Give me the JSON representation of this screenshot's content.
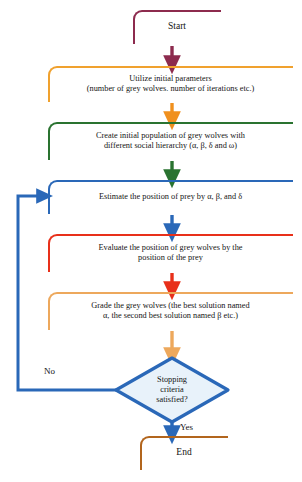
{
  "diagram": {
    "type": "flowchart",
    "background": "#ffffff",
    "nodes": [
      {
        "id": "start",
        "shape": "terminal",
        "label": "Start",
        "color": "#8d2b4e"
      },
      {
        "id": "init",
        "shape": "process",
        "label": "Utilize initial parameters\n(number of grey wolves. number of iterations etc.)",
        "color": "#f0a12e"
      },
      {
        "id": "create",
        "shape": "process",
        "label": "Create initial population of grey wolves with\ndifferent social hierarchy (α, β, δ and ω)",
        "color": "#2a7330"
      },
      {
        "id": "estimate",
        "shape": "process",
        "label": "Estimate the position of prey by α, β, and δ",
        "color": "#2a68b8"
      },
      {
        "id": "evaluate",
        "shape": "process",
        "label": "Evaluate the position of grey wolves by the\nposition of the prey",
        "color": "#e8301a"
      },
      {
        "id": "grade",
        "shape": "process",
        "label": "Grade the grey wolves (the best solution named\nα, the second best solution named β etc.)",
        "color": "#eda85c"
      },
      {
        "id": "decision",
        "shape": "decision",
        "label": "Stopping\ncriteria\nsatisfied?",
        "color": "#2a68b8",
        "fill": "#e8f2fa"
      },
      {
        "id": "end",
        "shape": "terminal",
        "label": "End",
        "color": "#b2651d"
      }
    ],
    "edges": [
      {
        "id": "start-to-init",
        "from": "start",
        "to": "init",
        "label": "",
        "color": "#8d2b4e"
      },
      {
        "id": "init-to-create",
        "from": "init",
        "to": "create",
        "label": "",
        "color": "#f0a12e"
      },
      {
        "id": "create-to-estimate",
        "from": "create",
        "to": "estimate",
        "label": "",
        "color": "#2a7330"
      },
      {
        "id": "estimate-to-evaluate",
        "from": "estimate",
        "to": "evaluate",
        "label": "",
        "color": "#2a68b8"
      },
      {
        "id": "evaluate-to-grade",
        "from": "evaluate",
        "to": "grade",
        "label": "",
        "color": "#e8301a"
      },
      {
        "id": "grade-to-decision",
        "from": "grade",
        "to": "decision",
        "label": "",
        "color": "#eda85c"
      },
      {
        "id": "decision-to-end",
        "from": "decision",
        "to": "end",
        "label": "Yes",
        "color": "#2a68b8"
      },
      {
        "id": "decision-to-estimate",
        "from": "decision",
        "to": "estimate",
        "label": "No",
        "color": "#2a68b8"
      }
    ],
    "edge_labels": {
      "no": "No",
      "yes": "Yes"
    }
  }
}
